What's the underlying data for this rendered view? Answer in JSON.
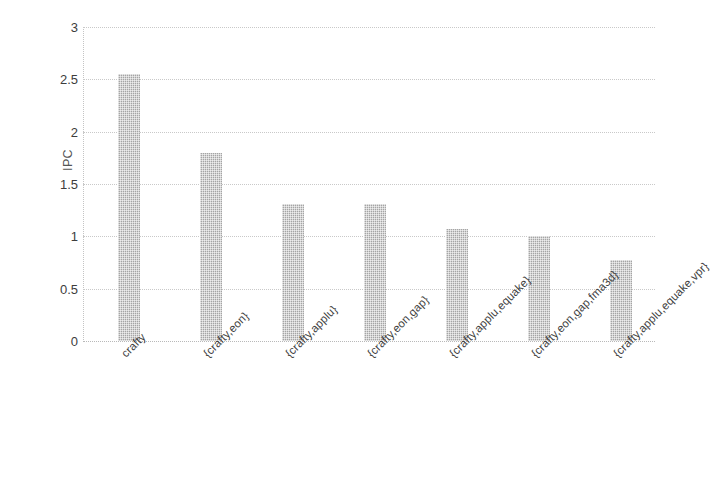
{
  "chart_data": {
    "type": "bar",
    "title": "",
    "subtitle": "",
    "xlabel": "",
    "ylabel": "IPC",
    "ylim": [
      0,
      3
    ],
    "ytick_labels": [
      "3",
      "2.5",
      "2",
      "1.5",
      "1",
      "0.5",
      "0"
    ],
    "ytick_values": [
      3,
      2.5,
      2,
      1.5,
      1,
      0.5,
      0
    ],
    "grid": true,
    "legend": "none",
    "bar_color": "#a5a5a5",
    "categories": [
      "crafty",
      "{crafty,eon}",
      "{crafty,applu}",
      "{crafty,eon,gap}",
      "{crafty,applu,equake}",
      "{crafty,eon,gap,fma3d}",
      "{crafty,applu,equake,vpr}"
    ],
    "values": [
      2.55,
      1.8,
      1.31,
      1.31,
      1.07,
      1.0,
      0.77
    ]
  }
}
